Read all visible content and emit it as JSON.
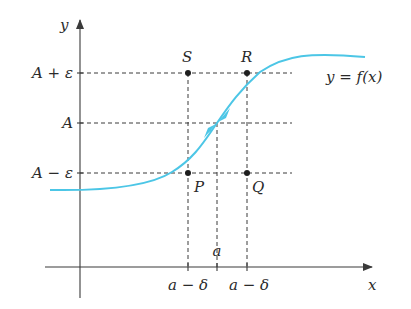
{
  "figure": {
    "axis_labels": {
      "x": "x",
      "y": "y"
    },
    "y_levels": [
      {
        "key": "upper",
        "label": "A + ε"
      },
      {
        "key": "mid",
        "label": "A"
      },
      {
        "key": "lower",
        "label": "A − ε"
      }
    ],
    "x_ticks": [
      {
        "key": "left",
        "label": "a − δ"
      },
      {
        "key": "center",
        "label": "a"
      },
      {
        "key": "right",
        "label": "a − δ"
      }
    ],
    "points": [
      {
        "key": "S",
        "label": "S"
      },
      {
        "key": "R",
        "label": "R"
      },
      {
        "key": "P",
        "label": "P"
      },
      {
        "key": "Q",
        "label": "Q"
      }
    ],
    "curve_label": "y = f(x)",
    "colors": {
      "curve": "#4cc6e6",
      "axes": "#3a3a3a",
      "text": "#2a2a2a"
    }
  }
}
